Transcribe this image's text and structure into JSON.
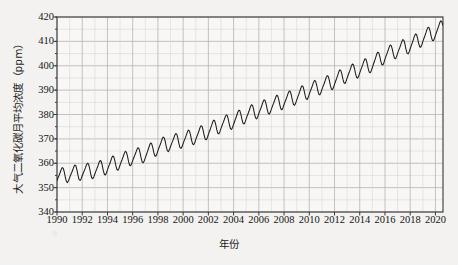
{
  "chart_data": {
    "type": "line",
    "title": "",
    "xlabel": "年份",
    "ylabel": "大气二氧化碳月平均浓度（ppm）",
    "ylabel_unit": "ppm",
    "xlim": [
      1990,
      2020.6
    ],
    "ylim": [
      340,
      420
    ],
    "ytick_labels": [
      "340",
      "350",
      "360",
      "370",
      "380",
      "390",
      "400",
      "410",
      "420"
    ],
    "ytick_values": [
      340,
      350,
      360,
      370,
      380,
      390,
      400,
      410,
      420
    ],
    "ytick_step": 10,
    "yminor_step": 5,
    "xtick_labels": [
      "1990",
      "1992",
      "1994",
      "1996",
      "1998",
      "2000",
      "2002",
      "2004",
      "2006",
      "2008",
      "2010",
      "2012",
      "2014",
      "2016",
      "2018",
      "2020"
    ],
    "xtick_values": [
      1990,
      1992,
      1994,
      1996,
      1998,
      2000,
      2002,
      2004,
      2006,
      2008,
      2010,
      2012,
      2014,
      2016,
      2018,
      2020
    ],
    "xminor_step": 1,
    "grid": true,
    "legend": false,
    "line_color": "#1c1c1c",
    "grid_color": "#b8b8b8",
    "axis_color": "#3a3a3a",
    "background": "#f6f5f3",
    "series": [
      {
        "name": "大气二氧化碳月平均浓度",
        "description": "Monthly mean atmospheric CO2 concentration with seasonal cycle superimposed on rising trend",
        "annual_mean_x": [
          1990,
          1991,
          1992,
          1993,
          1994,
          1995,
          1996,
          1997,
          1998,
          1999,
          2000,
          2001,
          2002,
          2003,
          2004,
          2005,
          2006,
          2007,
          2008,
          2009,
          2010,
          2011,
          2012,
          2013,
          2014,
          2015,
          2016,
          2017,
          2018,
          2019,
          2020
        ],
        "annual_mean_values": [
          354.4,
          355.6,
          356.4,
          357.1,
          358.8,
          360.8,
          362.6,
          363.7,
          366.7,
          368.4,
          369.6,
          371.2,
          373.3,
          375.8,
          377.5,
          379.8,
          381.9,
          383.8,
          385.6,
          387.4,
          389.9,
          391.7,
          393.9,
          396.5,
          398.6,
          400.8,
          404.2,
          406.6,
          408.5,
          411.4,
          414.0
        ],
        "seasonal_amplitude": 6.2,
        "seasonal_peak_month": 5,
        "seasonal_trough_month": 10,
        "start_value": 353.8,
        "end_value": 410.0,
        "max_value": 414.6,
        "min_value": 351.3
      }
    ]
  },
  "axes": {
    "x_title": "年份",
    "y_title": "大气二氧化碳月平均浓度（ppm）"
  }
}
